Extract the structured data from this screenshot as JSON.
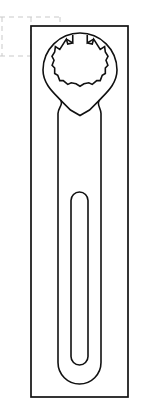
{
  "document": {
    "title": "Box-End Wrench Technical Drawing",
    "kind": "line-drawing",
    "background_color": "#ffffff",
    "width": 141,
    "height": 419
  },
  "colors": {
    "outline": "#111111",
    "frame": "#111111",
    "guide": "#c9c9c9",
    "fill": "#ffffff"
  },
  "frame": {
    "name": "drawing-border",
    "x": 31,
    "y": 26,
    "width": 97,
    "height": 371,
    "stroke_width": 1.7
  },
  "guides": {
    "name": "construction-grid",
    "stroke": "#c9c9c9",
    "dash": "5 4",
    "vertical_lines_x": [
      2,
      31,
      60
    ],
    "horizontal_lines_y": [
      17,
      56
    ],
    "extent_x": [
      0,
      60
    ],
    "extent_y": [
      17,
      56
    ]
  },
  "wrench": {
    "name": "box-end-wrench",
    "head": {
      "name": "ring-head",
      "center_x": 80,
      "center_y": 70,
      "outer_radius": 37,
      "socket_radius": 28,
      "points": 12,
      "opening": {
        "present": true,
        "position": "top",
        "gap_degrees": 30
      }
    },
    "handle": {
      "name": "handle-shaft",
      "left_x": 58,
      "right_x": 101,
      "shoulder_y": 113,
      "tip_y": 384,
      "tip_radius": 21.5
    },
    "slot": {
      "name": "handle-slot",
      "left_x": 71,
      "right_x": 88,
      "top_y": 192,
      "bottom_y": 365,
      "corner_radius": 8.5
    }
  },
  "chart_data": {
    "type": "table",
    "title": "Box-End Wrench Technical Drawing",
    "categories": [
      "frame",
      "ring head",
      "handle",
      "handle slot",
      "guides"
    ],
    "values": [
      371,
      74,
      271,
      173,
      39
    ],
    "xlabel": "feature",
    "ylabel": "extent (px)"
  }
}
